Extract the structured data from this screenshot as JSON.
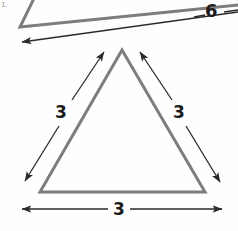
{
  "figure": {
    "kind": "geometry-diagram",
    "background_color": "#fefefe",
    "shape_stroke_color": "#7d7d7d",
    "dimension_stroke_color": "#2a2a2a",
    "label_color": "#1c1c1c",
    "corner_mark": "1."
  },
  "shapes": {
    "small_triangle": {
      "name": "equilateral-triangle",
      "apex": {
        "x": 122,
        "y": 50
      },
      "bottom_left": {
        "x": 40,
        "y": 192
      },
      "bottom_right": {
        "x": 205,
        "y": 192
      },
      "stroke_width": 3
    },
    "large_triangle": {
      "name": "cropped-large-triangle",
      "left_vertex": {
        "x": 20,
        "y": 27
      },
      "upper_point": {
        "x": 44,
        "y": -22
      },
      "right_point": {
        "x": 268,
        "y": 2
      },
      "stroke_width": 3
    }
  },
  "dimensions": [
    {
      "id": "left-leg",
      "label": "3",
      "from": {
        "x": 104,
        "y": 52
      },
      "to": {
        "x": 25,
        "y": 181
      },
      "arrows": "both"
    },
    {
      "id": "right-leg",
      "label": "3",
      "from": {
        "x": 140,
        "y": 52
      },
      "to": {
        "x": 220,
        "y": 182
      },
      "arrows": "both"
    },
    {
      "id": "base",
      "label": "3",
      "from": {
        "x": 22,
        "y": 209
      },
      "to": {
        "x": 222,
        "y": 209
      },
      "arrows": "both"
    },
    {
      "id": "large-triangle-side",
      "label": "6",
      "from": {
        "x": 22,
        "y": 42
      },
      "to": {
        "x": 238,
        "y": 12
      },
      "arrows": "start"
    }
  ]
}
